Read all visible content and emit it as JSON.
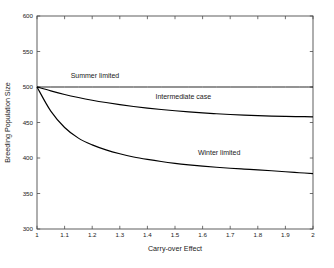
{
  "chart_data": {
    "type": "line",
    "title": "",
    "xlabel": "Carry-over Effect",
    "ylabel": "Breeding Population Size",
    "xlim": [
      1,
      2
    ],
    "ylim": [
      300,
      600
    ],
    "grid": false,
    "legend_position": "inline-labels",
    "x_ticks": [
      "1",
      "1.1",
      "1.2",
      "1.3",
      "1.4",
      "1.5",
      "1.6",
      "1.7",
      "1.8",
      "1.9",
      "2"
    ],
    "x_tick_values": [
      1,
      1.1,
      1.2,
      1.3,
      1.4,
      1.5,
      1.6,
      1.7,
      1.8,
      1.9,
      2
    ],
    "y_ticks": [
      "300",
      "350",
      "400",
      "450",
      "500",
      "550",
      "600"
    ],
    "y_tick_values": [
      300,
      350,
      400,
      450,
      500,
      550,
      600
    ],
    "x": [
      1,
      1.05,
      1.1,
      1.15,
      1.2,
      1.25,
      1.3,
      1.35,
      1.4,
      1.45,
      1.5,
      1.55,
      1.6,
      1.65,
      1.7,
      1.75,
      1.8,
      1.85,
      1.9,
      1.95,
      2
    ],
    "series": [
      {
        "name": "Summer limited",
        "label": "Summer limited",
        "color": "#000000",
        "values": [
          500,
          500,
          500,
          500,
          500,
          500,
          500,
          500,
          500,
          500,
          500,
          500,
          500,
          500,
          500,
          500,
          500,
          500,
          500,
          500,
          500
        ],
        "annotation": {
          "text": "Summer limited",
          "x": 1.21,
          "y": 512
        }
      },
      {
        "name": "Intermediate case",
        "label": "Intermediate case",
        "color": "#000000",
        "values": [
          500,
          494.5,
          489.5,
          485.2,
          481.4,
          478.1,
          475.2,
          472.6,
          470.3,
          468.3,
          466.5,
          464.9,
          463.5,
          462.3,
          461.2,
          460.3,
          459.6,
          459.0,
          458.6,
          458.3,
          458.0
        ],
        "annotation": {
          "text": "Intermediate case",
          "x": 1.53,
          "y": 483
        }
      },
      {
        "name": "Winter limited",
        "label": "Winter limited",
        "color": "#000000",
        "values": [
          500,
          466.0,
          443.0,
          428.0,
          418.5,
          411.5,
          406.0,
          401.5,
          398.0,
          395.0,
          392.5,
          390.4,
          388.6,
          387.0,
          385.6,
          384.4,
          383.3,
          382.0,
          380.6,
          379.3,
          378.0
        ],
        "annotation": {
          "text": "Winter limited",
          "x": 1.66,
          "y": 404
        }
      }
    ]
  }
}
